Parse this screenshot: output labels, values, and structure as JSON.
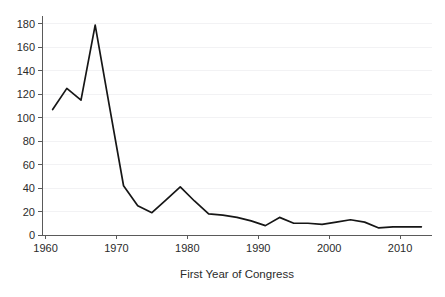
{
  "chart_data": {
    "type": "line",
    "title": "",
    "subtitle": "",
    "xlabel": "First Year of Congress",
    "ylabel": "",
    "xlim": [
      1959.5,
      2014.5
    ],
    "ylim": [
      0,
      185
    ],
    "grid": "horizontal",
    "legend": "none",
    "xticks": [
      1960,
      1970,
      1980,
      1990,
      2000,
      2010
    ],
    "xtick_labels": [
      "1960",
      "1970",
      "1980",
      "1990",
      "2000",
      "2010"
    ],
    "yticks": [
      0,
      20,
      40,
      60,
      80,
      100,
      120,
      140,
      160,
      180
    ],
    "ytick_labels": [
      "0",
      "20",
      "40",
      "60",
      "80",
      "100",
      "120",
      "140",
      "160",
      "180"
    ],
    "series": [
      {
        "name": "Count",
        "color": "#161616",
        "x": [
          1961,
          1963,
          1965,
          1967,
          1969,
          1971,
          1973,
          1975,
          1977,
          1979,
          1981,
          1983,
          1985,
          1987,
          1989,
          1991,
          1993,
          1995,
          1997,
          1999,
          2001,
          2003,
          2005,
          2007,
          2009,
          2011,
          2013
        ],
        "values": [
          107,
          125,
          115,
          179,
          110,
          42,
          25,
          19,
          30,
          41,
          29,
          18,
          17,
          15,
          12,
          8,
          15,
          10,
          10,
          9,
          11,
          13,
          11,
          6,
          7,
          7,
          7
        ]
      }
    ]
  },
  "axis": {
    "x_title": "First Year of Congress"
  }
}
